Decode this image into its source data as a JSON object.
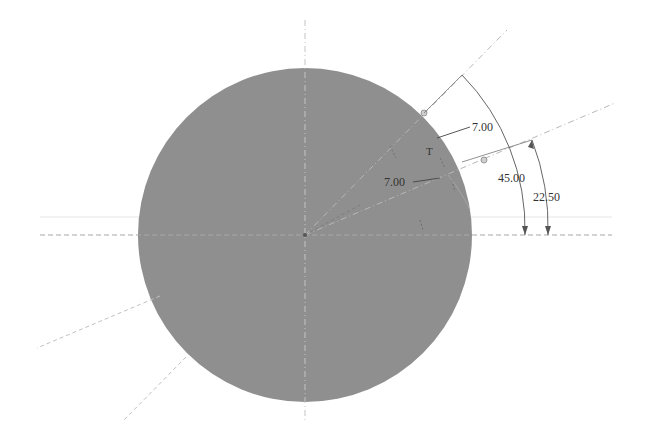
{
  "sketch": {
    "circle": {
      "cx": 305,
      "cy": 235,
      "r": 167,
      "fill": "#8f8f8f"
    },
    "center_lines": {
      "vertical": {
        "x": 305,
        "y1": 20,
        "y2": 420
      },
      "horizontal": {
        "y": 235,
        "x1": 40,
        "x2": 612
      },
      "faint_horizontal": {
        "y": 217,
        "x1": 40,
        "x2": 612
      }
    },
    "construction_lines": [
      {
        "name": "line-45deg",
        "x1": 305,
        "y1": 235,
        "x2": 507,
        "y2": 30
      },
      {
        "name": "line-22.5deg",
        "x1": 305,
        "y1": 235,
        "x2": 615,
        "y2": 103
      },
      {
        "name": "line-lower-left-1",
        "x1": 160,
        "y1": 296,
        "x2": 37,
        "y2": 348
      },
      {
        "name": "line-lower-left-2",
        "x1": 186,
        "y1": 357,
        "x2": 124,
        "y2": 420
      }
    ],
    "dimensions": {
      "radius_top": {
        "label": "7.00",
        "text_x": 472,
        "text_y": 131
      },
      "radius_inner": {
        "label": "7.00",
        "text_x": 384,
        "text_y": 186
      },
      "angle_45": {
        "label": "45.00",
        "text_x": 498,
        "text_y": 182
      },
      "angle_22_5": {
        "label": "22.50",
        "text_x": 533,
        "text_y": 201
      }
    },
    "constraint_label": "T",
    "colors": {
      "fill": "#8f8f8f",
      "dim_line": "#555555",
      "construction": "#b8b8b8"
    }
  }
}
